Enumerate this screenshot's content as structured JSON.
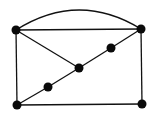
{
  "diagram": {
    "type": "graph",
    "background": "#ffffff",
    "stroke_color": "#111111",
    "node_color": "#0a0a0a",
    "node_radius": 4.5,
    "nodes": [
      {
        "id": "TL",
        "x": 16,
        "y": 30
      },
      {
        "id": "TR",
        "x": 141,
        "y": 29
      },
      {
        "id": "BL",
        "x": 17,
        "y": 105
      },
      {
        "id": "BR",
        "x": 142,
        "y": 104
      },
      {
        "id": "C",
        "x": 79,
        "y": 68
      },
      {
        "id": "M1",
        "x": 111,
        "y": 48
      },
      {
        "id": "M2",
        "x": 48,
        "y": 87
      }
    ],
    "edges": [
      {
        "from": "TL",
        "to": "TR",
        "kind": "line"
      },
      {
        "from": "TL",
        "to": "TR",
        "kind": "arc"
      },
      {
        "from": "TL",
        "to": "BL",
        "kind": "line"
      },
      {
        "from": "TR",
        "to": "BR",
        "kind": "line"
      },
      {
        "from": "BL",
        "to": "BR",
        "kind": "line"
      },
      {
        "from": "TL",
        "to": "C",
        "kind": "line"
      },
      {
        "from": "TR",
        "to": "M1",
        "kind": "line"
      },
      {
        "from": "M1",
        "to": "C",
        "kind": "line"
      },
      {
        "from": "C",
        "to": "M2",
        "kind": "line"
      },
      {
        "from": "M2",
        "to": "BL",
        "kind": "line"
      }
    ],
    "arc_peak_y": 10
  }
}
